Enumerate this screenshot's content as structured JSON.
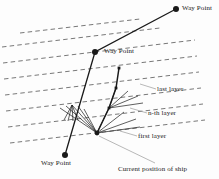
{
  "figure": {
    "labels": {
      "waypoint_top": "Way Point",
      "waypoint_middle": "Way Point",
      "waypoint_bottom": "Way Point",
      "last_layer": "last layer",
      "nth_layer": "n-th layer",
      "first_layer": "first layer",
      "current_position": "Current position of ship"
    },
    "colors": {
      "ink": "#1a1a1a",
      "dashed_layer": "#555555",
      "leader": "#9a9a9a",
      "background": "#fdfdfd"
    }
  },
  "chart_data": {
    "type": "diagram",
    "xlabel": "",
    "ylabel": "",
    "xlim": [
      0,
      219
    ],
    "ylim": [
      0,
      179
    ],
    "grid": false,
    "legend": "none",
    "waypoints": [
      {
        "name": "Way Point",
        "x": 176,
        "y": 9,
        "label_side": "right"
      },
      {
        "name": "Way Point",
        "x": 95,
        "y": 52,
        "label_side": "right"
      },
      {
        "name": "Way Point",
        "x": 65,
        "y": 155,
        "label_side": "below"
      }
    ],
    "route_polyline": [
      {
        "x": 176,
        "y": 9
      },
      {
        "x": 95,
        "y": 52
      },
      {
        "x": 65,
        "y": 155
      }
    ],
    "ship_position": {
      "x": 97,
      "y": 133,
      "label": "Current position of ship"
    },
    "layers": [
      {
        "name": "first layer",
        "x1": 10,
        "y1": 143,
        "x2": 205,
        "y2": 120
      },
      {
        "name": "layer",
        "x1": 8,
        "y1": 127,
        "x2": 203,
        "y2": 104
      },
      {
        "name": "n-th layer",
        "x1": 6,
        "y1": 111,
        "x2": 201,
        "y2": 88
      },
      {
        "name": "layer",
        "x1": 5,
        "y1": 95,
        "x2": 199,
        "y2": 72
      },
      {
        "name": "last layer",
        "x1": 4,
        "y1": 79,
        "x2": 197,
        "y2": 56
      },
      {
        "name": "layer",
        "x1": 3,
        "y1": 63,
        "x2": 195,
        "y2": 40
      },
      {
        "name": "layer",
        "x1": 2,
        "y1": 47,
        "x2": 160,
        "y2": 28
      },
      {
        "name": "layer",
        "x1": 20,
        "y1": 33,
        "x2": 140,
        "y2": 19
      }
    ],
    "tree_nodes": [
      {
        "id": "root",
        "x": 97,
        "y": 133
      },
      {
        "id": "sel1",
        "x": 109,
        "y": 108
      },
      {
        "id": "sel2",
        "x": 116,
        "y": 88
      },
      {
        "id": "sel3",
        "x": 119,
        "y": 68
      }
    ],
    "selected_branch": [
      {
        "x": 97,
        "y": 133
      },
      {
        "x": 109,
        "y": 108
      },
      {
        "x": 116,
        "y": 88
      },
      {
        "x": 119,
        "y": 68
      }
    ],
    "fan_from_root": [
      {
        "x": 60,
        "y": 108
      },
      {
        "x": 66,
        "y": 106
      },
      {
        "x": 72,
        "y": 105
      },
      {
        "x": 78,
        "y": 106
      },
      {
        "x": 84,
        "y": 109
      },
      {
        "x": 109,
        "y": 108
      },
      {
        "x": 124,
        "y": 112
      },
      {
        "x": 136,
        "y": 119
      },
      {
        "x": 140,
        "y": 127
      }
    ],
    "fan_from_sel1": [
      {
        "x": 116,
        "y": 88
      },
      {
        "x": 128,
        "y": 91
      },
      {
        "x": 138,
        "y": 96
      },
      {
        "x": 143,
        "y": 103
      }
    ],
    "leader_lines": [
      {
        "from": {
          "x": 155,
          "y": 163
        },
        "to": {
          "x": 99,
          "y": 136
        },
        "name": "ship-leader"
      },
      {
        "from": {
          "x": 156,
          "y": 89
        },
        "to": {
          "x": 140,
          "y": 84
        },
        "name": "last-layer-leader"
      },
      {
        "from": {
          "x": 147,
          "y": 113
        },
        "to": {
          "x": 130,
          "y": 108
        },
        "name": "nth-layer-leader"
      },
      {
        "from": {
          "x": 137,
          "y": 136
        },
        "to": {
          "x": 120,
          "y": 131
        },
        "name": "first-layer-leader"
      }
    ]
  }
}
